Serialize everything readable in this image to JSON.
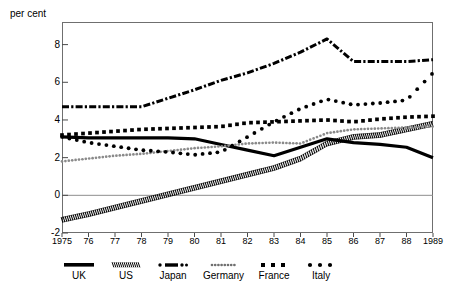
{
  "chart_data": {
    "type": "line",
    "title": "",
    "subtitle": "",
    "ylabel": "per cent",
    "xlabel": "",
    "ylim": [
      -2,
      9.2
    ],
    "xlim": [
      1975,
      1989
    ],
    "grid": false,
    "zero_line": true,
    "legend_position": "bottom",
    "x": [
      1975,
      1976,
      1977,
      1978,
      1979,
      1980,
      1981,
      1982,
      1983,
      1984,
      1985,
      1986,
      1987,
      1988,
      1989
    ],
    "xtick_labels": [
      "1975",
      "76",
      "77",
      "78",
      "79",
      "80",
      "81",
      "82",
      "83",
      "84",
      "85",
      "86",
      "87",
      "88",
      "1989"
    ],
    "ytick_labels": [
      "8",
      "6",
      "4",
      "2",
      "0",
      "-2"
    ],
    "ytick_values": [
      8,
      6,
      4,
      2,
      0,
      -2
    ],
    "series": [
      {
        "name": "UK",
        "style": "solid-thick",
        "color": "#000000",
        "values": [
          3.1,
          3.05,
          3.05,
          3.05,
          3.05,
          3.0,
          2.7,
          2.4,
          2.1,
          2.55,
          3.0,
          2.8,
          2.7,
          2.55,
          2.0
        ]
      },
      {
        "name": "US",
        "style": "hatched",
        "color": "#000000",
        "values": [
          -1.3,
          -1.0,
          -0.65,
          -0.3,
          0.05,
          0.4,
          0.75,
          1.1,
          1.45,
          1.95,
          2.75,
          3.1,
          3.2,
          3.5,
          3.8
        ]
      },
      {
        "name": "Japan",
        "style": "dash-dot",
        "color": "#000000",
        "values": [
          4.7,
          4.7,
          4.7,
          4.7,
          5.15,
          5.6,
          6.1,
          6.5,
          7.0,
          7.6,
          8.3,
          7.1,
          7.1,
          7.1,
          7.2
        ]
      },
      {
        "name": "Germany",
        "style": "fine-dotted",
        "color": "#8a8a8a",
        "values": [
          1.8,
          1.95,
          2.1,
          2.2,
          2.35,
          2.5,
          2.6,
          2.75,
          2.8,
          2.75,
          3.3,
          3.5,
          3.55,
          3.6,
          3.65
        ]
      },
      {
        "name": "France",
        "style": "square-dotted",
        "color": "#000000",
        "values": [
          3.2,
          3.3,
          3.4,
          3.5,
          3.55,
          3.6,
          3.65,
          3.85,
          3.9,
          3.95,
          4.0,
          3.9,
          4.05,
          4.15,
          4.2
        ]
      },
      {
        "name": "Italy",
        "style": "round-dotted",
        "color": "#000000",
        "values": [
          3.1,
          2.8,
          2.6,
          2.4,
          2.3,
          2.15,
          2.3,
          3.1,
          3.9,
          4.6,
          5.1,
          4.8,
          4.9,
          5.05,
          6.5
        ]
      }
    ]
  },
  "legend": {
    "items": [
      {
        "label": "UK",
        "swatch": "solid-thick"
      },
      {
        "label": "US",
        "swatch": "hatched"
      },
      {
        "label": "Japan",
        "swatch": "dash-dot"
      },
      {
        "label": "Germany",
        "swatch": "fine-dotted"
      },
      {
        "label": "France",
        "swatch": "square-dotted"
      },
      {
        "label": "Italy",
        "swatch": "round-dotted"
      }
    ]
  }
}
